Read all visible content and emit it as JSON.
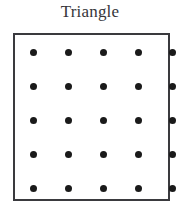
{
  "title": "Triangle",
  "colors": {
    "page_background": "#ffffff",
    "title_text": "#35353a",
    "box_border": "#3a3a3e",
    "box_fill": "#ffffff",
    "dot": "#1a1a1a"
  },
  "grid": {
    "rows": 5,
    "columns": 5,
    "dot_count": 25,
    "dot_diameter_px": 7,
    "row_centers_y": [
      17,
      51,
      85,
      119,
      153
    ],
    "column_centers_x": [
      18,
      53,
      88,
      123,
      157
    ]
  },
  "chart_data": {
    "type": "scatter",
    "title": "Triangle",
    "xlabel": "",
    "ylabel": "",
    "grid": false,
    "legend": null,
    "xlim": [
      1,
      5
    ],
    "ylim": [
      1,
      5
    ],
    "xticks": [
      1,
      2,
      3,
      4,
      5
    ],
    "yticks": [
      1,
      2,
      3,
      4,
      5
    ],
    "series": [
      {
        "name": "dots",
        "marker": "filled-circle",
        "color": "#1a1a1a",
        "x": [
          1,
          2,
          3,
          4,
          5,
          1,
          2,
          3,
          4,
          5,
          1,
          2,
          3,
          4,
          5,
          1,
          2,
          3,
          4,
          5,
          1,
          2,
          3,
          4,
          5
        ],
        "y": [
          5,
          5,
          5,
          5,
          5,
          4,
          4,
          4,
          4,
          4,
          3,
          3,
          3,
          3,
          3,
          2,
          2,
          2,
          2,
          2,
          1,
          1,
          1,
          1,
          1
        ]
      }
    ]
  }
}
